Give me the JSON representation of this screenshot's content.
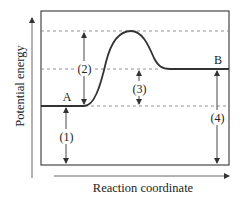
{
  "diagram": {
    "y_axis_label": "Potential energy",
    "x_axis_label": "Reaction coordinate",
    "states": [
      {
        "id": "A",
        "label": "A"
      },
      {
        "id": "B",
        "label": "B"
      }
    ],
    "intervals": [
      {
        "id": "1",
        "label": "(1)"
      },
      {
        "id": "2",
        "label": "(2)"
      },
      {
        "id": "3",
        "label": "(3)"
      },
      {
        "id": "4",
        "label": "(4)"
      }
    ],
    "colors": {
      "line": "#333333",
      "dashed": "#777777",
      "axis": "#666666"
    }
  }
}
